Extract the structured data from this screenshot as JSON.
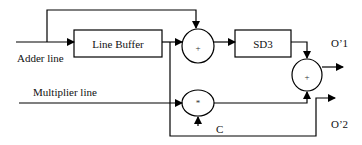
{
  "diagram": {
    "inputs": {
      "adder_line": "Adder line",
      "multiplier_line": "Multiplier line",
      "constant": "C"
    },
    "blocks": {
      "line_buffer": "Line Buffer",
      "sd3": "SD3"
    },
    "operators": {
      "adder1": "+",
      "multiplier": "*",
      "adder2": "+"
    },
    "outputs": {
      "o1": "O’1",
      "o2": "O’2"
    },
    "colors": {
      "stroke": "#000000",
      "background": "#ffffff"
    }
  }
}
